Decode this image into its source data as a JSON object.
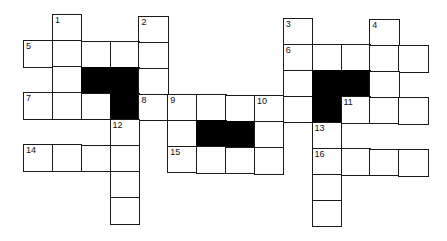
{
  "puzzle": {
    "cols": 14,
    "rows": 9,
    "colors": {
      "cell": "#ffffff",
      "block": "#000000",
      "border": "#1a1a1a"
    },
    "cells": [
      {
        "r": 0,
        "c": 1,
        "n": "1"
      },
      {
        "r": 0,
        "c": 4,
        "n": "2"
      },
      {
        "r": 0,
        "c": 9,
        "n": "3"
      },
      {
        "r": 0,
        "c": 12,
        "n": "4"
      },
      {
        "r": 1,
        "c": 0,
        "n": "5"
      },
      {
        "r": 1,
        "c": 1
      },
      {
        "r": 1,
        "c": 2
      },
      {
        "r": 1,
        "c": 3
      },
      {
        "r": 1,
        "c": 4
      },
      {
        "r": 1,
        "c": 9,
        "n": "6"
      },
      {
        "r": 1,
        "c": 10
      },
      {
        "r": 1,
        "c": 11
      },
      {
        "r": 1,
        "c": 12
      },
      {
        "r": 1,
        "c": 13
      },
      {
        "r": 2,
        "c": 1
      },
      {
        "r": 2,
        "c": 2,
        "b": true
      },
      {
        "r": 2,
        "c": 3,
        "b": true
      },
      {
        "r": 2,
        "c": 4
      },
      {
        "r": 2,
        "c": 9
      },
      {
        "r": 2,
        "c": 10,
        "b": true
      },
      {
        "r": 2,
        "c": 11,
        "b": true
      },
      {
        "r": 2,
        "c": 12
      },
      {
        "r": 3,
        "c": 0,
        "n": "7"
      },
      {
        "r": 3,
        "c": 1
      },
      {
        "r": 3,
        "c": 2
      },
      {
        "r": 3,
        "c": 3,
        "b": true
      },
      {
        "r": 3,
        "c": 4,
        "n": "8"
      },
      {
        "r": 3,
        "c": 5,
        "n": "9"
      },
      {
        "r": 3,
        "c": 6
      },
      {
        "r": 3,
        "c": 7
      },
      {
        "r": 3,
        "c": 8,
        "n": "10"
      },
      {
        "r": 3,
        "c": 9
      },
      {
        "r": 3,
        "c": 10,
        "b": true
      },
      {
        "r": 3,
        "c": 11,
        "n": "11"
      },
      {
        "r": 3,
        "c": 12
      },
      {
        "r": 3,
        "c": 13
      },
      {
        "r": 4,
        "c": 3,
        "n": "12"
      },
      {
        "r": 4,
        "c": 5
      },
      {
        "r": 4,
        "c": 6,
        "b": true
      },
      {
        "r": 4,
        "c": 7,
        "b": true
      },
      {
        "r": 4,
        "c": 8
      },
      {
        "r": 4,
        "c": 10,
        "n": "13"
      },
      {
        "r": 5,
        "c": 0,
        "n": "14"
      },
      {
        "r": 5,
        "c": 1
      },
      {
        "r": 5,
        "c": 2
      },
      {
        "r": 5,
        "c": 3
      },
      {
        "r": 5,
        "c": 5,
        "n": "15"
      },
      {
        "r": 5,
        "c": 6
      },
      {
        "r": 5,
        "c": 7
      },
      {
        "r": 5,
        "c": 8
      },
      {
        "r": 5,
        "c": 10,
        "n": "16"
      },
      {
        "r": 5,
        "c": 11
      },
      {
        "r": 5,
        "c": 12
      },
      {
        "r": 5,
        "c": 13
      },
      {
        "r": 6,
        "c": 3
      },
      {
        "r": 6,
        "c": 10
      },
      {
        "r": 7,
        "c": 3
      },
      {
        "r": 7,
        "c": 10
      }
    ]
  }
}
